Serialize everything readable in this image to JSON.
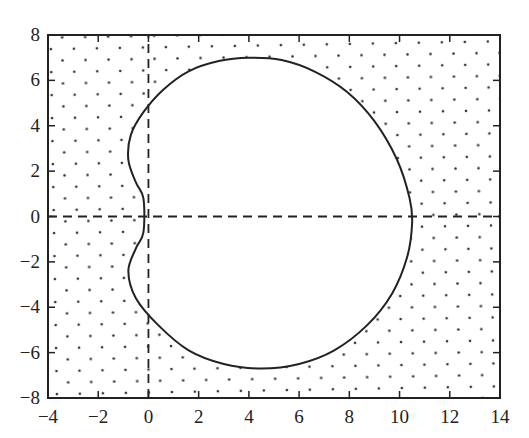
{
  "chart_data": {
    "type": "line",
    "title": "",
    "xlabel": "",
    "ylabel": "",
    "xlim": [
      -4,
      14
    ],
    "ylim": [
      -8,
      8
    ],
    "x_ticks": [
      "−4",
      "−2",
      "0",
      "2",
      "4",
      "6",
      "8",
      "10",
      "12",
      "14"
    ],
    "y_ticks": [
      "8",
      "6",
      "4",
      "2",
      "0",
      "−2",
      "−4",
      "−6",
      "−8"
    ],
    "grid": false,
    "legend": null,
    "fill": "dotted region outside closed curve",
    "series": [
      {
        "name": "boundary curve",
        "style": "solid",
        "points": [
          [
            -0.2,
            0.8
          ],
          [
            -0.5,
            1.5
          ],
          [
            -0.8,
            2.5
          ],
          [
            -0.7,
            3.6
          ],
          [
            -0.2,
            4.6
          ],
          [
            0.6,
            5.6
          ],
          [
            1.6,
            6.4
          ],
          [
            2.8,
            6.85
          ],
          [
            4.0,
            7.0
          ],
          [
            5.3,
            6.9
          ],
          [
            6.6,
            6.4
          ],
          [
            7.9,
            5.5
          ],
          [
            9.0,
            4.2
          ],
          [
            9.9,
            2.5
          ],
          [
            10.4,
            0.8
          ],
          [
            10.5,
            -0.3
          ],
          [
            10.3,
            -1.8
          ],
          [
            9.7,
            -3.4
          ],
          [
            8.7,
            -4.8
          ],
          [
            7.4,
            -5.9
          ],
          [
            6.0,
            -6.5
          ],
          [
            4.5,
            -6.7
          ],
          [
            3.0,
            -6.5
          ],
          [
            1.6,
            -5.9
          ],
          [
            0.4,
            -4.8
          ],
          [
            -0.5,
            -3.6
          ],
          [
            -0.8,
            -2.4
          ],
          [
            -0.5,
            -1.4
          ],
          [
            -0.2,
            -0.7
          ],
          [
            -0.2,
            0.8
          ]
        ]
      },
      {
        "name": "vertical axis line",
        "style": "dashed",
        "points": [
          [
            0,
            -8
          ],
          [
            0,
            8
          ]
        ]
      },
      {
        "name": "horizontal axis line",
        "style": "dashed",
        "points": [
          [
            -4,
            0
          ],
          [
            14,
            0
          ]
        ]
      }
    ]
  }
}
